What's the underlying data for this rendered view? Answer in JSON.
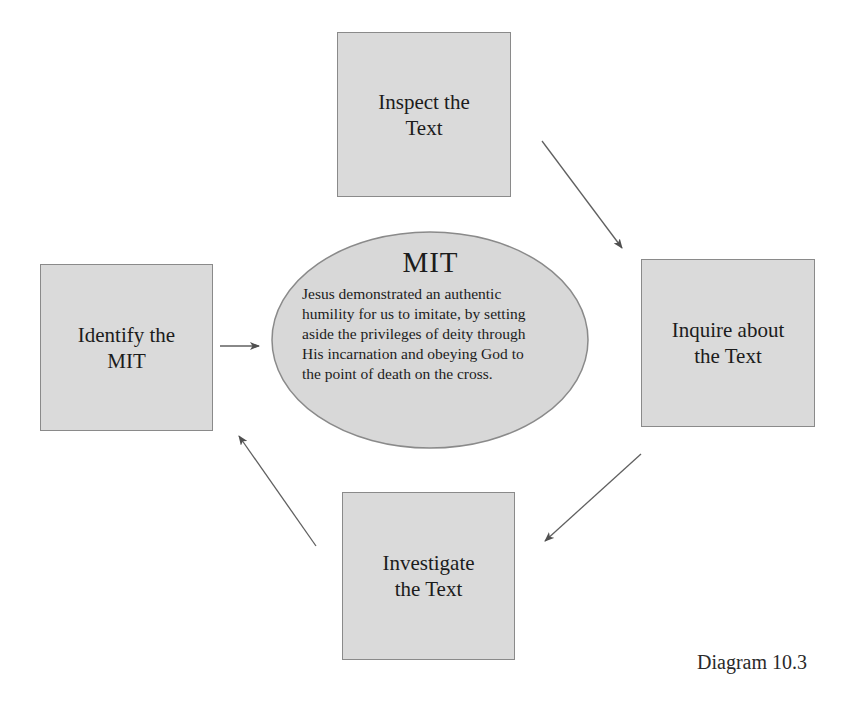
{
  "diagram": {
    "center": {
      "title": "MIT",
      "body_lines": [
        "Jesus demonstrated an authentic",
        "humility for us to imitate, by setting",
        "aside the privileges of deity through",
        "His incarnation and obeying God to",
        "the point of death on the cross."
      ]
    },
    "steps": [
      {
        "id": "inspect",
        "lines": [
          "Inspect the",
          "Text"
        ]
      },
      {
        "id": "inquire",
        "lines": [
          "Inquire about",
          "the Text"
        ]
      },
      {
        "id": "investigate",
        "lines": [
          "Investigate",
          "the Text"
        ]
      },
      {
        "id": "identify",
        "lines": [
          "Identify the",
          "MIT"
        ]
      }
    ],
    "flow": [
      {
        "from": "inspect",
        "to": "inquire"
      },
      {
        "from": "inquire",
        "to": "investigate"
      },
      {
        "from": "investigate",
        "to": "identify"
      },
      {
        "from": "identify",
        "to": "center"
      }
    ],
    "caption": "Diagram 10.3"
  },
  "colors": {
    "box_fill": "#dadada",
    "box_border": "#8a8a8a",
    "ellipse_fill": "#d8d8d8",
    "ellipse_border": "#8a8a8a",
    "arrow": "#555555",
    "text": "#1c1c1c",
    "background": "#ffffff"
  }
}
